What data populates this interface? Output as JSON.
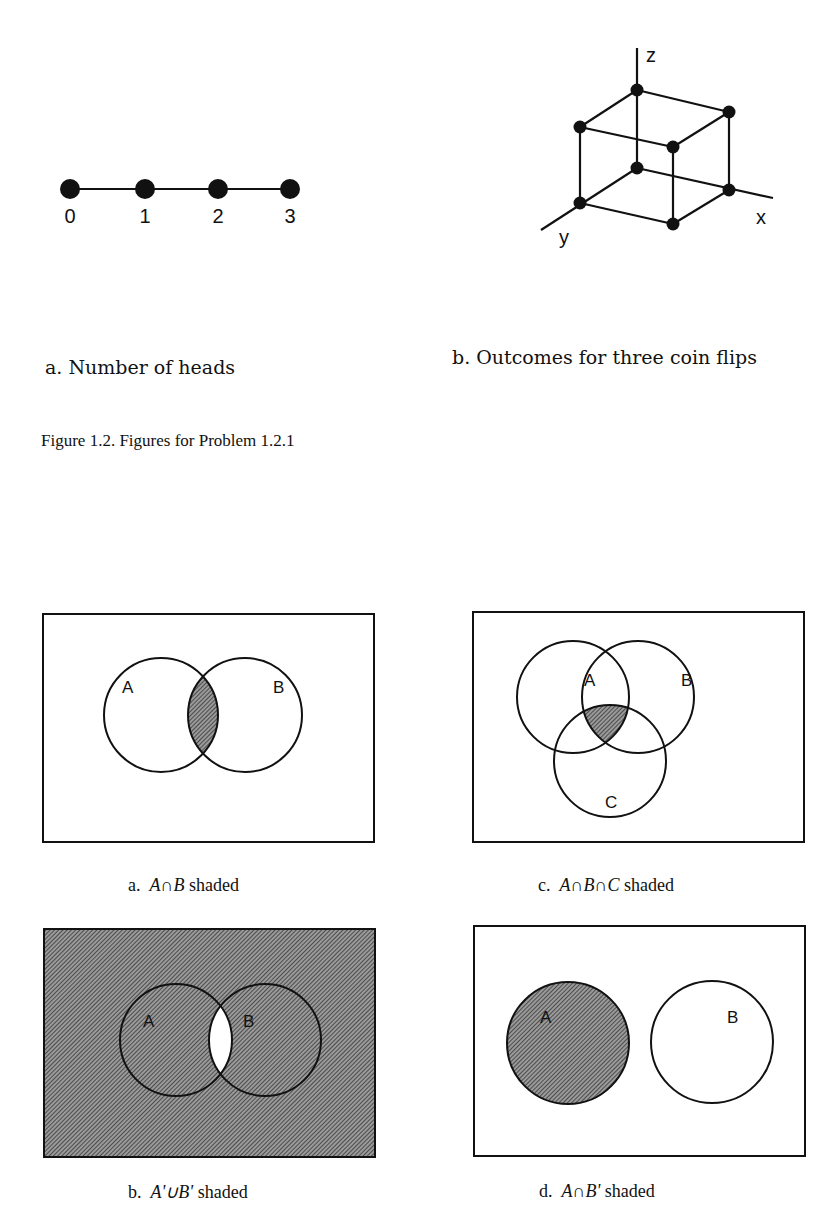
{
  "figure_1_2": {
    "panel_a": {
      "caption": "a.  Number of heads",
      "points": [
        "0",
        "1",
        "2",
        "3"
      ]
    },
    "panel_b": {
      "caption": "b.  Outcomes for three coin flips",
      "axes": {
        "x": "x",
        "y": "y",
        "z": "z"
      },
      "vertex_count": 8
    },
    "title": "Figure 1.2.  Figures for Problem 1.2.1"
  },
  "venn_diagrams": [
    {
      "id": "a",
      "caption_prefix": "a.",
      "caption_expr": "A∩B",
      "caption_suffix": "shaded",
      "sets": [
        "A",
        "B"
      ],
      "shaded_region": "intersection of A and B"
    },
    {
      "id": "c",
      "caption_prefix": "c.",
      "caption_expr": "A∩B∩C",
      "caption_suffix": "shaded",
      "sets": [
        "A",
        "B",
        "C"
      ],
      "shaded_region": "intersection of A, B and C"
    },
    {
      "id": "b",
      "caption_prefix": "b.",
      "caption_expr": "A'∪B'",
      "caption_suffix": "shaded",
      "sets": [
        "A",
        "B"
      ],
      "shaded_region": "everything except intersection of A and B"
    },
    {
      "id": "d",
      "caption_prefix": "d.",
      "caption_expr": "A∩B'",
      "caption_suffix": "shaded",
      "sets": [
        "A",
        "B"
      ],
      "shaded_region": "A (disjoint from B)"
    }
  ],
  "colors": {
    "ink": "#111111",
    "hatch": "#333333",
    "paper": "#ffffff"
  }
}
